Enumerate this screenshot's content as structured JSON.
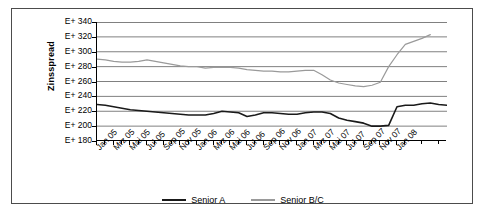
{
  "chart_data": {
    "type": "line",
    "title": "",
    "xlabel": "",
    "ylabel": "Zinsspread",
    "ylim": [
      180,
      340
    ],
    "ytick_step": 20,
    "ytick_labels": [
      "E+ 340",
      "E+ 320",
      "E+ 300",
      "E+ 280",
      "E+ 260",
      "E+ 240",
      "E+ 220",
      "E+ 200",
      "E+ 180"
    ],
    "ytick_values": [
      340,
      320,
      300,
      280,
      260,
      240,
      220,
      200,
      180
    ],
    "grid": true,
    "legend_position": "bottom",
    "x": [
      "Jan 05",
      "Feb 05",
      "Mrz 05",
      "Apr 05",
      "Mai 05",
      "Jun 05",
      "Jul 05",
      "Aug 05",
      "Sep 05",
      "Okt 05",
      "Nov 05",
      "Dez 05",
      "Jan 06",
      "Feb 06",
      "Mrz 06",
      "Apr 06",
      "Mai 06",
      "Jun 06",
      "Jul 06",
      "Aug 06",
      "Sep 06",
      "Okt 06",
      "Nov 06",
      "Dez 06",
      "Jan 07",
      "Feb 07",
      "Mrz 07",
      "Apr 07",
      "Mai 07",
      "Jun 07",
      "Jul 07",
      "Aug 07",
      "Sep 07",
      "Okt 07",
      "Nov 07",
      "Dez 07",
      "Jan 08",
      "Feb 08"
    ],
    "xtick_labels": [
      "Jan 05",
      "Mrz 05",
      "Mai 05",
      "Jul 05",
      "Sep 05",
      "Nov 05",
      "Jan 06",
      "Mrz 06",
      "Mai 06",
      "Jul 06",
      "Sep 06",
      "Nov 06",
      "Jan 07",
      "Mrz 07",
      "Mai 07",
      "Jul 07",
      "Sep 07",
      "Nov 07",
      "Jan 08"
    ],
    "series": [
      {
        "name": "Senior A",
        "color": "#1a1a1a",
        "values": [
          229,
          228,
          226,
          224,
          222,
          221,
          220,
          219,
          218,
          217,
          216,
          215,
          215,
          215,
          217,
          220,
          219,
          218,
          213,
          215,
          218,
          218,
          217,
          216,
          216,
          218,
          219,
          219,
          217,
          211,
          208,
          206,
          204,
          200,
          200,
          201,
          226,
          228
        ]
      },
      {
        "name": "Senior B/C",
        "color": "#9a9a9a",
        "values": [
          290,
          289,
          287,
          286,
          286,
          287,
          289,
          287,
          285,
          283,
          281,
          280,
          280,
          278,
          279,
          279,
          279,
          278,
          276,
          275,
          274,
          274,
          273,
          273,
          274,
          275,
          275,
          269,
          262,
          258,
          256,
          254,
          253,
          255,
          259,
          280,
          296,
          310
        ]
      }
    ],
    "series_end_extra": {
      "Senior A": [
        228,
        230,
        231,
        229,
        228
      ],
      "Senior B/C": [
        314,
        318,
        323
      ]
    }
  },
  "legend": {
    "items": [
      {
        "label": "Senior A",
        "color": "#1a1a1a"
      },
      {
        "label": "Senior B/C",
        "color": "#9a9a9a"
      }
    ]
  }
}
